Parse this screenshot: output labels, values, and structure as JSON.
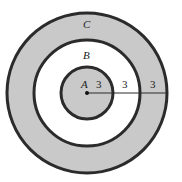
{
  "diagram": {
    "type": "concentric-circles",
    "center": {
      "x": 87,
      "y": 93
    },
    "colors": {
      "shaded": "#c9c9c9",
      "unshaded": "#ffffff",
      "stroke": "#2b2b2b"
    },
    "regions": [
      {
        "id": "A",
        "label": "A",
        "shaded": true,
        "label_pos": {
          "x": 83,
          "y": 86
        }
      },
      {
        "id": "B",
        "label": "B",
        "shaded": false,
        "label_pos": {
          "x": 83,
          "y": 59
        }
      },
      {
        "id": "C",
        "label": "C",
        "shaded": true,
        "label_pos": {
          "x": 83,
          "y": 27
        }
      }
    ],
    "circles": [
      {
        "name": "outer",
        "r": 80
      },
      {
        "name": "middle",
        "r": 53
      },
      {
        "name": "inner",
        "r": 26
      }
    ],
    "radius_segments": [
      {
        "label": "3",
        "pos": {
          "x": 97,
          "y": 87
        }
      },
      {
        "label": "3",
        "pos": {
          "x": 122,
          "y": 87
        }
      },
      {
        "label": "3",
        "pos": {
          "x": 151,
          "y": 87
        }
      }
    ]
  }
}
